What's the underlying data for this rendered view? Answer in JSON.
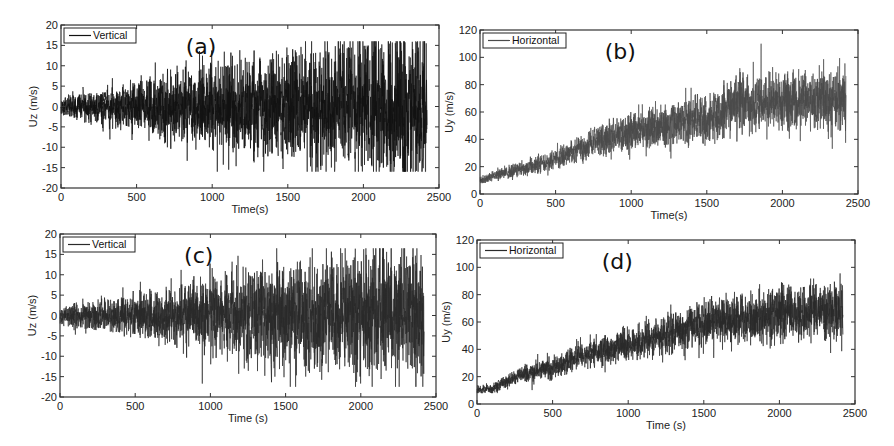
{
  "chart_data": [
    {
      "id": "a",
      "type": "line",
      "panel_label": "(a)",
      "title": "",
      "xlabel": "Time(s)",
      "ylabel": "Uz (m/s)",
      "xlim": [
        0,
        2500
      ],
      "ylim": [
        -20,
        20
      ],
      "xticks": [
        0,
        500,
        1000,
        1500,
        2000,
        2500
      ],
      "yticks": [
        -20,
        -15,
        -10,
        -5,
        0,
        5,
        10,
        15,
        20
      ],
      "grid": false,
      "legend": {
        "position": "upper-left",
        "entries": [
          "Vertical"
        ]
      },
      "series": [
        {
          "name": "Vertical",
          "color": "#111111",
          "x_range": [
            0,
            2420
          ],
          "description": "zero-mean fluctuating signal, amplitude growing over time",
          "envelope": [
            [
              0,
              1.5
            ],
            [
              500,
              4
            ],
            [
              1000,
              7
            ],
            [
              1500,
              9
            ],
            [
              2000,
              11
            ],
            [
              2420,
              12
            ]
          ],
          "mean": [
            [
              0,
              0
            ],
            [
              2420,
              0
            ]
          ],
          "peak_max": 16,
          "peak_min": -16
        }
      ],
      "frame": {
        "left": 61,
        "top": 25,
        "right": 439,
        "bottom": 188
      }
    },
    {
      "id": "b",
      "type": "line",
      "panel_label": "(b)",
      "title": "",
      "xlabel": "Time(s)",
      "ylabel": "Uy (m/s)",
      "xlim": [
        0,
        2500
      ],
      "ylim": [
        0,
        120
      ],
      "xticks": [
        0,
        500,
        1000,
        1500,
        2000,
        2500
      ],
      "yticks": [
        0,
        20,
        40,
        60,
        80,
        100,
        120
      ],
      "grid": false,
      "legend": {
        "position": "upper-left",
        "entries": [
          "Horizontal"
        ]
      },
      "series": [
        {
          "name": "Horizontal",
          "color": "#4a4a4a",
          "x_range": [
            0,
            2420
          ],
          "description": "rising trend with fluctuations",
          "mean": [
            [
              0,
              10
            ],
            [
              250,
              18
            ],
            [
              500,
              25
            ],
            [
              750,
              38
            ],
            [
              1000,
              45
            ],
            [
              1250,
              50
            ],
            [
              1500,
              55
            ],
            [
              1700,
              65
            ],
            [
              2000,
              68
            ],
            [
              2420,
              70
            ]
          ],
          "envelope": [
            [
              0,
              2
            ],
            [
              500,
              5
            ],
            [
              1000,
              9
            ],
            [
              1500,
              12
            ],
            [
              2000,
              14
            ],
            [
              2420,
              15
            ]
          ],
          "peak_max": 110,
          "peak_min": 8
        }
      ],
      "frame": {
        "left": 480,
        "top": 30,
        "right": 858,
        "bottom": 194
      }
    },
    {
      "id": "c",
      "type": "line",
      "panel_label": "(c)",
      "title": "",
      "xlabel": "Time (s)",
      "ylabel": "Uz (m/s)",
      "xlim": [
        0,
        2500
      ],
      "ylim": [
        -20,
        20
      ],
      "xticks": [
        0,
        500,
        1000,
        1500,
        2000,
        2500
      ],
      "yticks": [
        -20,
        -15,
        -10,
        -5,
        0,
        5,
        10,
        15,
        20
      ],
      "grid": false,
      "legend": {
        "position": "upper-left",
        "entries": [
          "Vertical"
        ]
      },
      "series": [
        {
          "name": "Vertical",
          "color": "#2a2a2a",
          "x_range": [
            0,
            2420
          ],
          "description": "zero-mean fluctuating signal, amplitude growing over time",
          "envelope": [
            [
              0,
              1.5
            ],
            [
              500,
              3.5
            ],
            [
              1000,
              6
            ],
            [
              1500,
              8
            ],
            [
              2000,
              10
            ],
            [
              2420,
              11
            ]
          ],
          "mean": [
            [
              0,
              0
            ],
            [
              2420,
              0
            ]
          ],
          "peak_max": 16.5,
          "peak_min": -17.5
        }
      ],
      "frame": {
        "left": 60,
        "top": 234,
        "right": 436,
        "bottom": 397
      }
    },
    {
      "id": "d",
      "type": "line",
      "panel_label": "(d)",
      "title": "",
      "xlabel": "Time (s)",
      "ylabel": "Uy (m/s)",
      "xlim": [
        0,
        2500
      ],
      "ylim": [
        0,
        120
      ],
      "xticks": [
        0,
        500,
        1000,
        1500,
        2000,
        2500
      ],
      "yticks": [
        0,
        20,
        40,
        60,
        80,
        100,
        120
      ],
      "grid": false,
      "legend": {
        "position": "upper-left",
        "entries": [
          "Horizontal"
        ]
      },
      "series": [
        {
          "name": "Horizontal",
          "color": "#2a2a2a",
          "x_range": [
            0,
            2420
          ],
          "description": "rising trend with fluctuations",
          "mean": [
            [
              0,
              10
            ],
            [
              100,
              11
            ],
            [
              250,
              20
            ],
            [
              500,
              27
            ],
            [
              750,
              37
            ],
            [
              1000,
              42
            ],
            [
              1250,
              50
            ],
            [
              1500,
              58
            ],
            [
              1750,
              63
            ],
            [
              2000,
              66
            ],
            [
              2420,
              70
            ]
          ],
          "envelope": [
            [
              0,
              2
            ],
            [
              500,
              5
            ],
            [
              1000,
              8
            ],
            [
              1500,
              11
            ],
            [
              2000,
              13
            ],
            [
              2420,
              14
            ]
          ],
          "peak_max": 97,
          "peak_min": 8
        }
      ],
      "frame": {
        "left": 477,
        "top": 240,
        "right": 855,
        "bottom": 404
      }
    }
  ]
}
